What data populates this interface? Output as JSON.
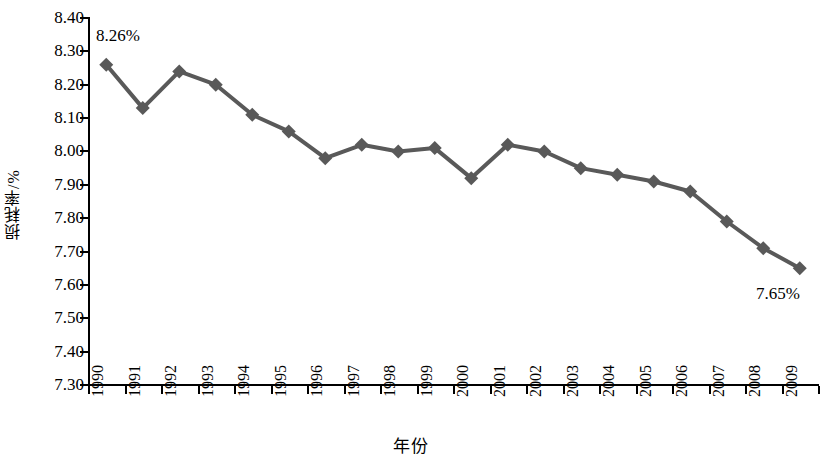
{
  "chart_data": {
    "type": "line",
    "title": "",
    "subtitle": "",
    "xlabel": "年份",
    "ylabel": "损耗率/%",
    "categories": [
      "1990",
      "1991",
      "1992",
      "1993",
      "1994",
      "1995",
      "1996",
      "1997",
      "1998",
      "1999",
      "2000",
      "2001",
      "2002",
      "2003",
      "2004",
      "2005",
      "2006",
      "2007",
      "2008",
      "2009"
    ],
    "values": [
      8.26,
      8.13,
      8.24,
      8.2,
      8.11,
      8.06,
      7.98,
      8.02,
      8.0,
      8.01,
      7.92,
      8.02,
      8.0,
      7.95,
      7.93,
      7.91,
      7.88,
      7.79,
      7.71,
      7.65
    ],
    "ylim": [
      7.3,
      8.4
    ],
    "ytick_step": 0.1,
    "ytick_labels": [
      "8.40",
      "8.30",
      "8.20",
      "8.10",
      "8.00",
      "7.90",
      "7.80",
      "7.70",
      "7.60",
      "7.50",
      "7.40",
      "7.30"
    ],
    "grid": false,
    "legend": "none",
    "series_color": "#595959",
    "axis_color": "#000000",
    "marker": "diamond",
    "annotations": [
      {
        "name": "first-value-label",
        "text": "8.26%",
        "category": "1990",
        "value": 8.26
      },
      {
        "name": "last-value-label",
        "text": "7.65%",
        "category": "2009",
        "value": 7.65
      }
    ]
  }
}
